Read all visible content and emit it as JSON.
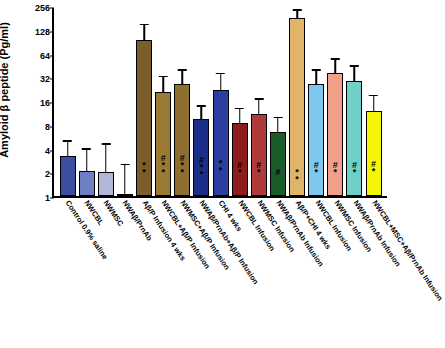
{
  "chart_data": {
    "type": "bar",
    "title": "",
    "xlabel": "",
    "ylabel": "Amyloid β peptide (Pg/ml)",
    "y_scale": "log2",
    "ylim": [
      1,
      256
    ],
    "yticks": [
      "1",
      "2",
      "4",
      "8",
      "16",
      "32",
      "64",
      "128",
      "256"
    ],
    "grid": false,
    "legend": "none",
    "categories": [
      "Control 0.9% saline",
      "NWCBL",
      "NWMSC",
      "NWAβ/PrnAb",
      "Aβ/P Infusion 4 wks",
      "NWCBL+Aβ/P Infusion",
      "NWMSC+Aβ/P Infusion",
      "NWAβ/PrnAb+Aβ/P Infusion",
      "CHI 4 wks",
      "NWCBL Infusion",
      "NWMSC Infusion",
      "NWAβ/PrnAb Infusion",
      "Aβ/P+CHI 4 wks",
      "NWCBL Infusion",
      "NWMSC Infusion",
      "NWAβ/PrnAb Infusion",
      "NWCBL+MSC+Aβ/PrnAb Infusion"
    ],
    "values": [
      3.2,
      2.1,
      2.0,
      1.0,
      96,
      21,
      26,
      9.5,
      22,
      8.5,
      11,
      6.5,
      180,
      26,
      36,
      29,
      12
    ],
    "error_upper": [
      5.0,
      4.0,
      4.6,
      2.4,
      150,
      33,
      40,
      14,
      36,
      13,
      17,
      10,
      230,
      40,
      55,
      45,
      19
    ],
    "annotations": [
      "",
      "",
      "",
      "",
      "*\n*",
      "#\n*\n*",
      "#\n*\n*",
      "#\n*\n*",
      "*\n*",
      "#\n*",
      "#\n*",
      "#",
      "*\n*",
      "#\n*",
      "#\n*",
      "#\n*",
      "#\n*"
    ],
    "colors": [
      "#3b4fa0",
      "#6f7fc4",
      "#b0b7d8",
      "#8a6b3a",
      "#7a5d2a",
      "#9a7a35",
      "#8f6f30",
      "#1b2f8a",
      "#2a3fa0",
      "#8c1d1d",
      "#b03a3a",
      "#1a5c2a",
      "#e0b56a",
      "#7ec8f0",
      "#f2a08a",
      "#6fd0c8",
      "#f5f50a"
    ]
  },
  "figure": {
    "caption": ""
  }
}
